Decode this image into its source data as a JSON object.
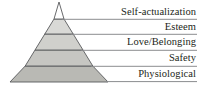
{
  "figure": {
    "type": "maslow-hierarchy-of-needs-pyramid",
    "background_color": "#ffffff",
    "outline_color": "#58595b",
    "label_color": "#231f20",
    "leader_line_color": "#808285",
    "geometry": {
      "apex": {
        "x": 59,
        "y": 2
      },
      "base_left": {
        "x": 10,
        "y": 82
      },
      "base_right": {
        "x": 108,
        "y": 82
      },
      "divider_y": [
        19,
        34,
        50,
        66
      ],
      "leader_line_x_end": 197
    },
    "tiers": [
      {
        "index": 0,
        "label": "Self-actualization",
        "fill": "#ffffff",
        "top_y": 2,
        "bottom_y": 19
      },
      {
        "index": 1,
        "label": "Esteem",
        "fill": "#d9d9d6",
        "top_y": 19,
        "bottom_y": 34
      },
      {
        "index": 2,
        "label": "Love/Belonging",
        "fill": "#d0d0cc",
        "top_y": 34,
        "bottom_y": 50
      },
      {
        "index": 3,
        "label": "Safety",
        "fill": "#c6c6c2",
        "top_y": 50,
        "bottom_y": 66
      },
      {
        "index": 4,
        "label": "Physiological",
        "fill": "#b9b9b4",
        "top_y": 66,
        "bottom_y": 82
      }
    ]
  }
}
